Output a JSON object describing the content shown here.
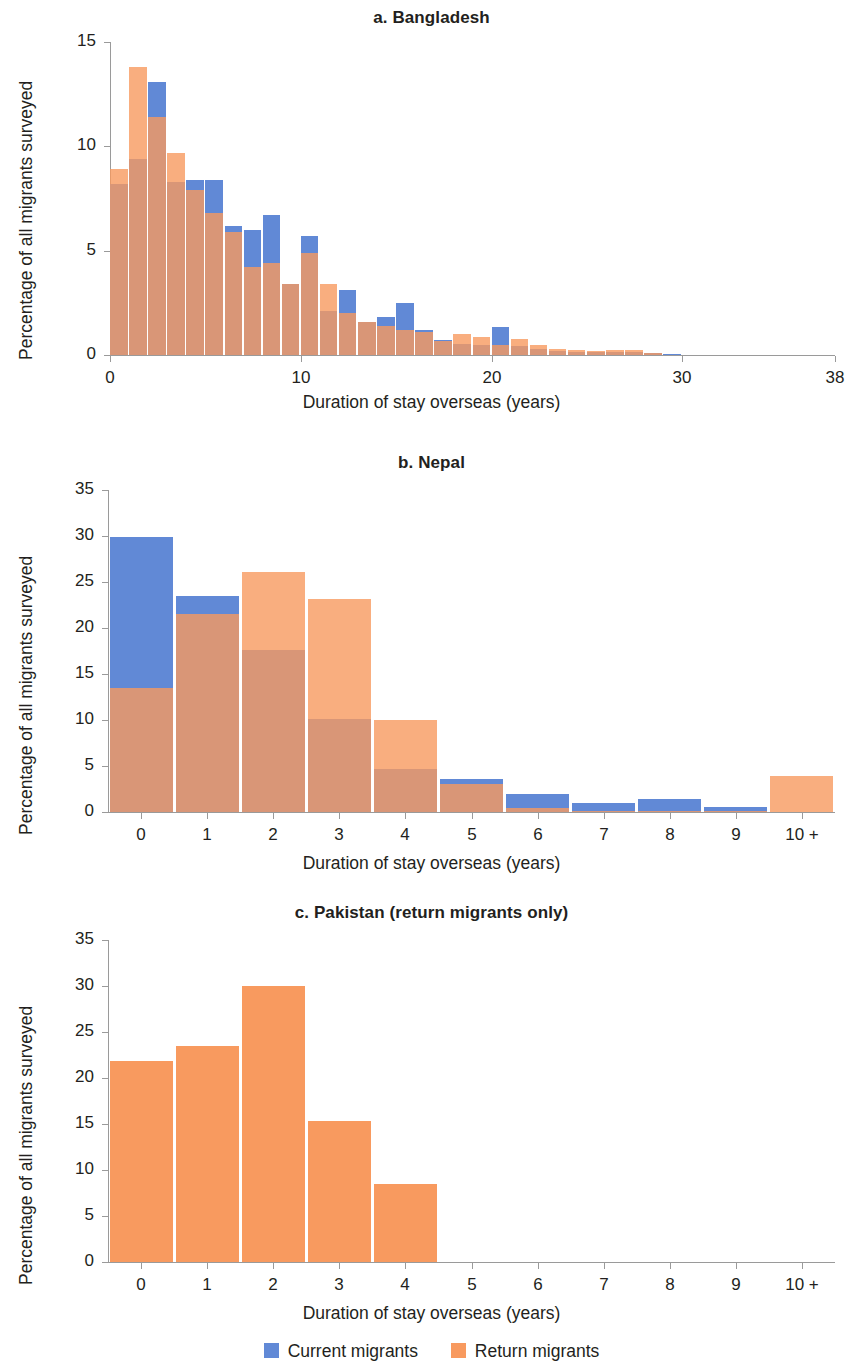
{
  "figure": {
    "shared_ylabel": "Percentage of all migrants surveyed",
    "shared_xlabel": "Duration of stay overseas (years)"
  },
  "legend": {
    "position": "bottom-center",
    "items": [
      {
        "label": "Current migrants",
        "color": "#6189d6",
        "key": "current"
      },
      {
        "label": "Return migrants",
        "color": "#f89a5f",
        "key": "return"
      }
    ]
  },
  "colors": {
    "current_migrants": "#6189d6",
    "return_migrants": "#f89a5f",
    "overlap": "#bf8164",
    "axis": "#9a9a9a",
    "text": "#231f20",
    "background": "#ffffff"
  },
  "chart_data": [
    {
      "type": "bar",
      "id": "a",
      "title": "a. Bangladesh",
      "xlabel": "Duration of stay overseas (years)",
      "ylabel": "Percentage of all migrants surveyed",
      "overlay": "transparent-overlapping-histograms",
      "grid": false,
      "xlim": [
        0,
        38
      ],
      "ylim": [
        0,
        15
      ],
      "yticks": [
        0,
        5,
        10,
        15
      ],
      "ytick_labels": [
        "0",
        "5",
        "10",
        "15"
      ],
      "xticks": [
        0,
        10,
        20,
        30,
        38
      ],
      "xtick_labels": [
        "0",
        "10",
        "20",
        "30",
        "38"
      ],
      "bin_width": 1,
      "x": [
        0,
        1,
        2,
        3,
        4,
        5,
        6,
        7,
        8,
        9,
        10,
        11,
        12,
        13,
        14,
        15,
        16,
        17,
        18,
        19,
        20,
        21,
        22,
        23,
        24,
        25,
        26,
        27,
        28,
        29
      ],
      "series": [
        {
          "name": "Current migrants",
          "color": "#6189d6",
          "values": [
            8.2,
            9.4,
            13.1,
            8.3,
            8.4,
            8.4,
            6.2,
            6.0,
            6.7,
            3.4,
            5.7,
            2.1,
            3.1,
            1.6,
            1.8,
            2.5,
            1.2,
            0.7,
            0.55,
            0.5,
            1.35,
            0.45,
            0.3,
            0.2,
            0.17,
            0.13,
            0.17,
            0.17,
            0.12,
            0.05
          ]
        },
        {
          "name": "Return migrants",
          "color": "#f89a5f",
          "values": [
            8.9,
            13.8,
            11.4,
            9.7,
            7.9,
            6.8,
            5.9,
            4.2,
            4.4,
            3.4,
            4.9,
            3.4,
            2.0,
            1.6,
            1.4,
            1.2,
            1.1,
            0.65,
            1.0,
            0.85,
            0.5,
            0.75,
            0.5,
            0.3,
            0.22,
            0.18,
            0.25,
            0.25,
            0.1,
            0.0
          ]
        }
      ]
    },
    {
      "type": "bar",
      "id": "b",
      "title": "b. Nepal",
      "xlabel": "Duration of stay overseas (years)",
      "ylabel": "Percentage of all migrants surveyed",
      "overlay": "transparent-overlapping-histograms",
      "grid": false,
      "ylim": [
        0,
        35
      ],
      "yticks": [
        0,
        5,
        10,
        15,
        20,
        25,
        30,
        35
      ],
      "ytick_labels": [
        "0",
        "5",
        "10",
        "15",
        "20",
        "25",
        "30",
        "35"
      ],
      "categories": [
        "0",
        "1",
        "2",
        "3",
        "4",
        "5",
        "6",
        "7",
        "8",
        "9",
        "10 +"
      ],
      "series": [
        {
          "name": "Current migrants",
          "color": "#6189d6",
          "values": [
            29.9,
            23.5,
            17.6,
            10.1,
            4.7,
            3.6,
            2.0,
            0.95,
            1.4,
            0.6,
            0.0
          ]
        },
        {
          "name": "Return migrants",
          "color": "#f89a5f",
          "values": [
            13.5,
            21.5,
            26.1,
            23.2,
            10.0,
            3.0,
            0.4,
            0.1,
            0.1,
            0.1,
            3.9
          ]
        }
      ]
    },
    {
      "type": "bar",
      "id": "c",
      "title": "c. Pakistan (return migrants only)",
      "xlabel": "Duration of stay overseas (years)",
      "ylabel": "Percentage of all migrants surveyed",
      "grid": false,
      "ylim": [
        0,
        35
      ],
      "yticks": [
        0,
        5,
        10,
        15,
        20,
        25,
        30,
        35
      ],
      "ytick_labels": [
        "0",
        "5",
        "10",
        "15",
        "20",
        "25",
        "30",
        "35"
      ],
      "categories": [
        "0",
        "1",
        "2",
        "3",
        "4",
        "5",
        "6",
        "7",
        "8",
        "9",
        "10 +"
      ],
      "series": [
        {
          "name": "Return migrants",
          "color": "#f89a5f",
          "values": [
            21.9,
            23.5,
            30.0,
            15.3,
            8.5,
            0,
            0,
            0,
            0,
            0,
            0
          ]
        }
      ]
    }
  ]
}
